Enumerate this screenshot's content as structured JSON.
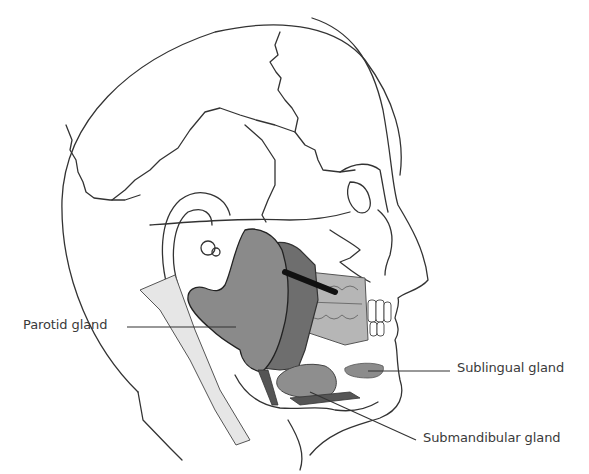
{
  "diagram": {
    "labels": [
      {
        "id": "parotid",
        "text": "Parotid gland"
      },
      {
        "id": "sublingual",
        "text": "Sublingual gland"
      },
      {
        "id": "submandibular",
        "text": "Submandibular gland"
      }
    ],
    "colors": {
      "outline": "#333333",
      "parotid_fill": "#8a8a8a",
      "masseter_fill": "#6e6e6e",
      "teeth_area_fill": "#b4b4b4",
      "neck_fill": "#e6e6e6",
      "gland_fill": "#8e8e8e",
      "duct": "#1a1a1a"
    }
  }
}
